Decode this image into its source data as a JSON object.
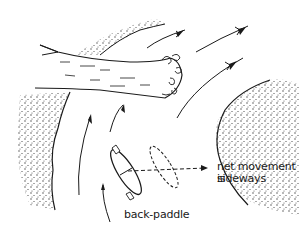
{
  "diagram": {
    "labels": {
      "net_movement_line1": "net movement is",
      "net_movement_line2": "sideways",
      "back_paddle": "back-paddle"
    },
    "elements": [
      "fallen-tree",
      "left-bank",
      "right-bank",
      "current-arrows",
      "kayak",
      "ghost-kayak",
      "sideways-arrow"
    ],
    "colors": {
      "ink": "#1a1a1a",
      "background": "#ffffff"
    }
  }
}
